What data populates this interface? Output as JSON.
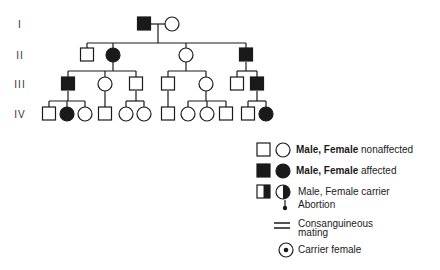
{
  "generations": [
    {
      "label": "I",
      "y": 24
    },
    {
      "label": "II",
      "y": 55
    },
    {
      "label": "III",
      "y": 84
    },
    {
      "label": "IV",
      "y": 114
    }
  ],
  "individuals": [
    {
      "id": "I-1",
      "sex": "male",
      "status": "affected",
      "x": 144,
      "y": 24
    },
    {
      "id": "I-2",
      "sex": "female",
      "status": "nonaffected",
      "x": 172,
      "y": 24
    },
    {
      "id": "II-1",
      "sex": "male",
      "status": "nonaffected",
      "x": 87,
      "y": 55
    },
    {
      "id": "II-2",
      "sex": "female",
      "status": "affected",
      "x": 113,
      "y": 55
    },
    {
      "id": "II-3",
      "sex": "female",
      "status": "nonaffected",
      "x": 186,
      "y": 55
    },
    {
      "id": "II-4",
      "sex": "male",
      "status": "affected",
      "x": 246,
      "y": 55
    },
    {
      "id": "III-1",
      "sex": "male",
      "status": "affected",
      "x": 68,
      "y": 84
    },
    {
      "id": "III-2",
      "sex": "female",
      "status": "nonaffected",
      "x": 105,
      "y": 84
    },
    {
      "id": "III-3",
      "sex": "male",
      "status": "nonaffected",
      "x": 136,
      "y": 84
    },
    {
      "id": "III-4",
      "sex": "male",
      "status": "nonaffected",
      "x": 168,
      "y": 84
    },
    {
      "id": "III-5",
      "sex": "female",
      "status": "nonaffected",
      "x": 206,
      "y": 84
    },
    {
      "id": "III-6",
      "sex": "male",
      "status": "nonaffected",
      "x": 237,
      "y": 84
    },
    {
      "id": "III-7",
      "sex": "male",
      "status": "affected",
      "x": 257,
      "y": 84
    },
    {
      "id": "IV-1",
      "sex": "male",
      "status": "nonaffected",
      "x": 49,
      "y": 114
    },
    {
      "id": "IV-2",
      "sex": "female",
      "status": "affected",
      "x": 67,
      "y": 114
    },
    {
      "id": "IV-3",
      "sex": "female",
      "status": "nonaffected",
      "x": 85,
      "y": 114
    },
    {
      "id": "IV-4",
      "sex": "male",
      "status": "nonaffected",
      "x": 105,
      "y": 114
    },
    {
      "id": "IV-5",
      "sex": "female",
      "status": "nonaffected",
      "x": 126,
      "y": 114
    },
    {
      "id": "IV-6",
      "sex": "female",
      "status": "nonaffected",
      "x": 144,
      "y": 114
    },
    {
      "id": "IV-7",
      "sex": "male",
      "status": "nonaffected",
      "x": 168,
      "y": 114
    },
    {
      "id": "IV-8",
      "sex": "female",
      "status": "nonaffected",
      "x": 188,
      "y": 114
    },
    {
      "id": "IV-9",
      "sex": "female",
      "status": "nonaffected",
      "x": 207,
      "y": 114
    },
    {
      "id": "IV-10",
      "sex": "male",
      "status": "nonaffected",
      "x": 226,
      "y": 114
    },
    {
      "id": "IV-11",
      "sex": "male",
      "status": "nonaffected",
      "x": 248,
      "y": 114
    },
    {
      "id": "IV-12",
      "sex": "female",
      "status": "affected",
      "x": 266,
      "y": 114
    }
  ],
  "lines": [
    [
      151,
      24,
      165,
      24
    ],
    [
      158,
      24,
      158,
      43
    ],
    [
      87,
      43,
      246,
      43
    ],
    [
      87,
      43,
      87,
      48
    ],
    [
      113,
      43,
      113,
      48
    ],
    [
      186,
      43,
      186,
      48
    ],
    [
      246,
      43,
      246,
      48
    ],
    [
      113,
      62,
      113,
      71
    ],
    [
      68,
      71,
      136,
      71
    ],
    [
      68,
      71,
      68,
      77
    ],
    [
      105,
      71,
      105,
      77
    ],
    [
      136,
      71,
      136,
      77
    ],
    [
      186,
      62,
      186,
      71
    ],
    [
      168,
      71,
      206,
      71
    ],
    [
      168,
      71,
      168,
      77
    ],
    [
      206,
      71,
      206,
      77
    ],
    [
      246,
      62,
      246,
      71
    ],
    [
      237,
      71,
      257,
      71
    ],
    [
      237,
      71,
      237,
      77
    ],
    [
      257,
      71,
      257,
      77
    ],
    [
      68,
      91,
      68,
      101
    ],
    [
      49,
      101,
      85,
      101
    ],
    [
      49,
      101,
      49,
      107
    ],
    [
      67,
      101,
      67,
      107
    ],
    [
      85,
      101,
      85,
      107
    ],
    [
      105,
      91,
      105,
      107
    ],
    [
      136,
      91,
      136,
      101
    ],
    [
      126,
      101,
      144,
      101
    ],
    [
      126,
      101,
      126,
      107
    ],
    [
      144,
      101,
      144,
      107
    ],
    [
      168,
      91,
      168,
      107
    ],
    [
      206,
      91,
      206,
      101
    ],
    [
      188,
      101,
      226,
      101
    ],
    [
      188,
      101,
      188,
      107
    ],
    [
      207,
      101,
      207,
      107
    ],
    [
      226,
      101,
      226,
      107
    ],
    [
      257,
      91,
      257,
      101
    ],
    [
      248,
      101,
      266,
      101
    ],
    [
      248,
      101,
      248,
      107
    ],
    [
      266,
      101,
      266,
      107
    ]
  ],
  "legend": {
    "items": [
      {
        "key": "nonaffected",
        "text": "Male, Female nonaffected",
        "bold_part": "Male, Female",
        "rest": " nonaffected",
        "y": 150
      },
      {
        "key": "affected",
        "text": "Male, Female affected",
        "bold_part": "Male, Female",
        "rest": " affected",
        "y": 171
      },
      {
        "key": "carrier",
        "text": "Male, Female carrier",
        "y": 192
      },
      {
        "key": "abortion",
        "text": "Abortion",
        "y": 205
      },
      {
        "key": "consanguineous",
        "text_line1": "Consanguineous",
        "text_line2": "mating",
        "y": 226
      },
      {
        "key": "carrier_female",
        "text": "Carrier female",
        "y": 250
      }
    ]
  },
  "colors": {
    "stroke": "#1a1a1a",
    "fill_affected": "#1a1a1a",
    "background": "#ffffff"
  }
}
